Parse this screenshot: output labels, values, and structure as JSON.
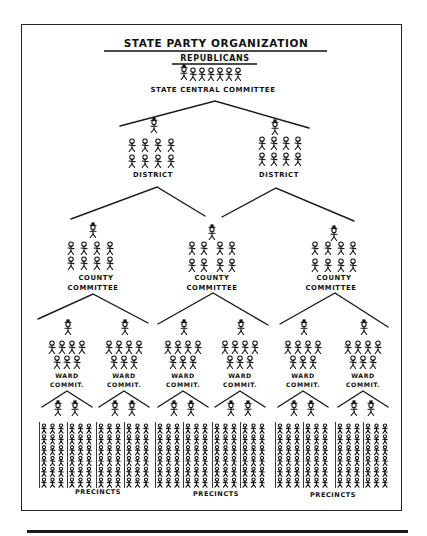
{
  "title": "STATE PARTY ORGANIZATION",
  "party": "REPUBLICANS",
  "state_committee": {
    "label": "STATE CENTRAL COMMITTEE",
    "figure_count": 6,
    "leader_count": 1
  },
  "districts": [
    {
      "label": "DISTRICT",
      "leader_count": 1,
      "member_count": 8
    },
    {
      "label": "DISTRICT",
      "leader_count": 1,
      "member_count": 8
    }
  ],
  "counties": [
    {
      "label_line1": "COUNTY",
      "label_line2": "COMMITTEE",
      "leader_count": 1,
      "member_count": 8
    },
    {
      "label_line1": "COUNTY",
      "label_line2": "COMMITTEE",
      "leader_count": 1,
      "member_count": 8
    },
    {
      "label_line1": "COUNTY",
      "label_line2": "COMMITTEE",
      "leader_count": 1,
      "member_count": 8
    }
  ],
  "wards": [
    {
      "label_line1": "WARD",
      "label_line2": "COMMIT.",
      "leader_count": 1,
      "member_count": 7
    },
    {
      "label_line1": "WARD",
      "label_line2": "COMMIT.",
      "leader_count": 1,
      "member_count": 7
    },
    {
      "label_line1": "WARD",
      "label_line2": "COMMIT.",
      "leader_count": 1,
      "member_count": 7
    },
    {
      "label_line1": "WARD",
      "label_line2": "COMMIT.",
      "leader_count": 1,
      "member_count": 7
    },
    {
      "label_line1": "WARD",
      "label_line2": "COMMIT.",
      "leader_count": 1,
      "member_count": 7
    },
    {
      "label_line1": "WARD",
      "label_line2": "COMMIT.",
      "leader_count": 1,
      "member_count": 7
    }
  ],
  "precinct_groups": [
    {
      "label": "PRECINCTS"
    },
    {
      "label": "PRECINCTS"
    },
    {
      "label": "PRECINCTS"
    }
  ],
  "precincts": {
    "leaders_per_ward": 2,
    "columns_per_ward": 2,
    "figures_per_column_row": 3,
    "rows": 6
  },
  "colors": {
    "ink": "#111111",
    "paper": "#ffffff"
  }
}
